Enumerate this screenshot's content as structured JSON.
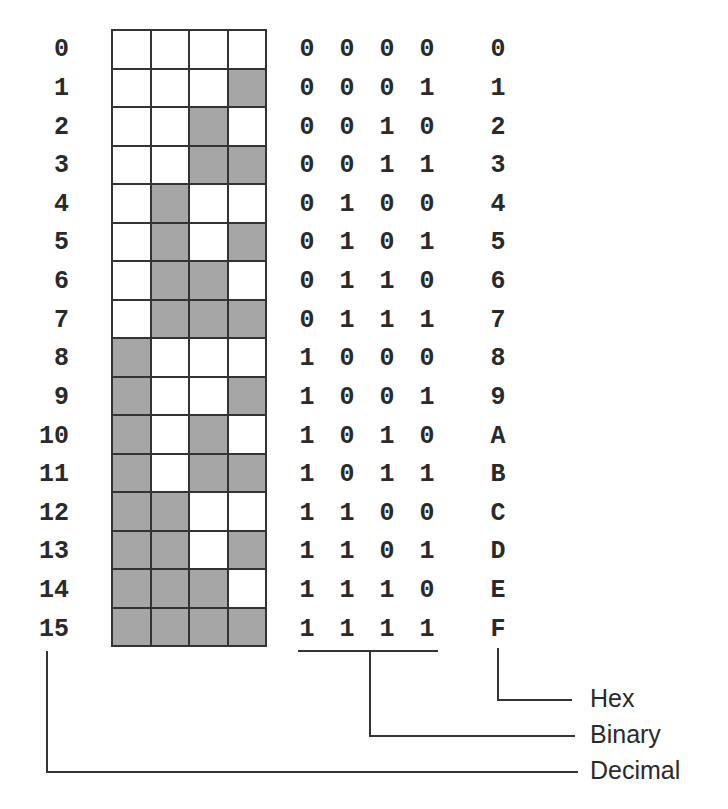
{
  "diagram": {
    "title": "",
    "colors": {
      "filled_cell": "#a6a6a6",
      "empty_cell": "#ffffff",
      "line": "#333333",
      "text": "#2a2a2a"
    },
    "legend": {
      "hex_label": "Hex",
      "binary_label": "Binary",
      "decimal_label": "Decimal"
    },
    "rows": [
      {
        "decimal": "0",
        "bits": [
          "0",
          "0",
          "0",
          "0"
        ],
        "hex": "0"
      },
      {
        "decimal": "1",
        "bits": [
          "0",
          "0",
          "0",
          "1"
        ],
        "hex": "1"
      },
      {
        "decimal": "2",
        "bits": [
          "0",
          "0",
          "1",
          "0"
        ],
        "hex": "2"
      },
      {
        "decimal": "3",
        "bits": [
          "0",
          "0",
          "1",
          "1"
        ],
        "hex": "3"
      },
      {
        "decimal": "4",
        "bits": [
          "0",
          "1",
          "0",
          "0"
        ],
        "hex": "4"
      },
      {
        "decimal": "5",
        "bits": [
          "0",
          "1",
          "0",
          "1"
        ],
        "hex": "5"
      },
      {
        "decimal": "6",
        "bits": [
          "0",
          "1",
          "1",
          "0"
        ],
        "hex": "6"
      },
      {
        "decimal": "7",
        "bits": [
          "0",
          "1",
          "1",
          "1"
        ],
        "hex": "7"
      },
      {
        "decimal": "8",
        "bits": [
          "1",
          "0",
          "0",
          "0"
        ],
        "hex": "8"
      },
      {
        "decimal": "9",
        "bits": [
          "1",
          "0",
          "0",
          "1"
        ],
        "hex": "9"
      },
      {
        "decimal": "10",
        "bits": [
          "1",
          "0",
          "1",
          "0"
        ],
        "hex": "A"
      },
      {
        "decimal": "11",
        "bits": [
          "1",
          "0",
          "1",
          "1"
        ],
        "hex": "B"
      },
      {
        "decimal": "12",
        "bits": [
          "1",
          "1",
          "0",
          "0"
        ],
        "hex": "C"
      },
      {
        "decimal": "13",
        "bits": [
          "1",
          "1",
          "0",
          "1"
        ],
        "hex": "D"
      },
      {
        "decimal": "14",
        "bits": [
          "1",
          "1",
          "1",
          "0"
        ],
        "hex": "E"
      },
      {
        "decimal": "15",
        "bits": [
          "1",
          "1",
          "1",
          "1"
        ],
        "hex": "F"
      }
    ]
  }
}
